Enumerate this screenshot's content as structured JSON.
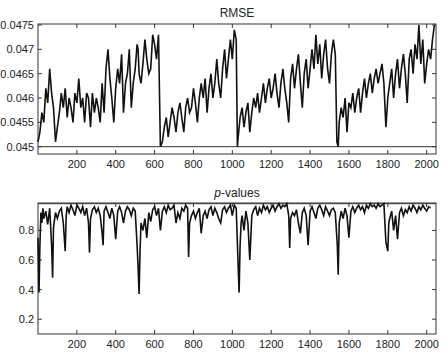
{
  "chart_data": [
    {
      "type": "line",
      "title": "RMSE",
      "xlabel": "",
      "ylabel": "",
      "xlim": [
        0,
        2048
      ],
      "ylim": [
        0.04485,
        0.04752
      ],
      "xticks": [
        200,
        400,
        600,
        800,
        1000,
        1200,
        1400,
        1600,
        1800,
        2000
      ],
      "yticks": [
        0.045,
        0.0455,
        0.046,
        0.0465,
        0.047,
        0.0475
      ],
      "ytick_labels": [
        "0.045",
        "0.0455",
        "0.046",
        "0.0465",
        "0.047",
        "0.0475"
      ],
      "grid": false,
      "reference_line": 0.045,
      "series": [
        {
          "name": "RMSE",
          "x": [
            0,
            10,
            20,
            30,
            40,
            50,
            60,
            70,
            80,
            90,
            100,
            110,
            120,
            130,
            140,
            150,
            160,
            170,
            180,
            190,
            200,
            210,
            220,
            230,
            240,
            250,
            260,
            270,
            280,
            290,
            300,
            310,
            320,
            330,
            340,
            350,
            360,
            370,
            380,
            390,
            400,
            410,
            420,
            430,
            440,
            450,
            460,
            470,
            480,
            490,
            500,
            510,
            515,
            520,
            530,
            540,
            550,
            560,
            570,
            580,
            590,
            600,
            610,
            620,
            630,
            640,
            650,
            660,
            670,
            680,
            690,
            700,
            710,
            720,
            730,
            740,
            750,
            760,
            770,
            780,
            790,
            800,
            810,
            820,
            830,
            840,
            850,
            860,
            870,
            880,
            890,
            900,
            910,
            920,
            930,
            940,
            950,
            960,
            970,
            980,
            990,
            1000,
            1010,
            1020,
            1026,
            1030,
            1040,
            1050,
            1060,
            1070,
            1080,
            1090,
            1100,
            1110,
            1120,
            1130,
            1140,
            1150,
            1160,
            1170,
            1180,
            1190,
            1200,
            1210,
            1220,
            1230,
            1240,
            1250,
            1260,
            1270,
            1280,
            1290,
            1300,
            1310,
            1320,
            1330,
            1340,
            1350,
            1360,
            1370,
            1380,
            1390,
            1400,
            1410,
            1420,
            1430,
            1440,
            1450,
            1460,
            1470,
            1480,
            1490,
            1500,
            1510,
            1520,
            1530,
            1538,
            1545,
            1550,
            1560,
            1570,
            1580,
            1590,
            1600,
            1610,
            1620,
            1630,
            1640,
            1650,
            1660,
            1670,
            1680,
            1690,
            1700,
            1710,
            1720,
            1730,
            1740,
            1750,
            1760,
            1770,
            1780,
            1790,
            1800,
            1810,
            1820,
            1830,
            1840,
            1850,
            1860,
            1870,
            1880,
            1890,
            1900,
            1910,
            1920,
            1930,
            1940,
            1950,
            1960,
            1970,
            1980,
            1990,
            2000,
            2010,
            2020,
            2030,
            2040,
            2048
          ],
          "values": [
            0.0451,
            0.0453,
            0.0457,
            0.0455,
            0.0462,
            0.0459,
            0.0466,
            0.0461,
            0.0458,
            0.0451,
            0.0454,
            0.0457,
            0.0461,
            0.0458,
            0.0462,
            0.0456,
            0.046,
            0.0458,
            0.0455,
            0.0461,
            0.0459,
            0.0464,
            0.0458,
            0.046,
            0.0455,
            0.0461,
            0.046,
            0.0454,
            0.0461,
            0.0457,
            0.046,
            0.0458,
            0.0455,
            0.0463,
            0.0457,
            0.0466,
            0.047,
            0.0464,
            0.046,
            0.0455,
            0.0462,
            0.0466,
            0.0463,
            0.0469,
            0.0457,
            0.0463,
            0.0465,
            0.047,
            0.0458,
            0.0463,
            0.0466,
            0.0471,
            0.047,
            0.0465,
            0.0463,
            0.0467,
            0.0472,
            0.0468,
            0.0465,
            0.0466,
            0.0473,
            0.0471,
            0.0468,
            0.0473,
            0.045,
            0.0451,
            0.0454,
            0.0456,
            0.0452,
            0.0455,
            0.0458,
            0.0456,
            0.0453,
            0.0457,
            0.0459,
            0.0456,
            0.0453,
            0.0458,
            0.046,
            0.0457,
            0.0458,
            0.0462,
            0.0459,
            0.0455,
            0.046,
            0.0463,
            0.046,
            0.0464,
            0.0457,
            0.0462,
            0.0465,
            0.046,
            0.0463,
            0.0468,
            0.0463,
            0.046,
            0.0466,
            0.047,
            0.0464,
            0.0468,
            0.0472,
            0.0468,
            0.0474,
            0.0472,
            0.045,
            0.0452,
            0.0456,
            0.0458,
            0.0454,
            0.0457,
            0.0459,
            0.0453,
            0.0457,
            0.046,
            0.0458,
            0.0461,
            0.0457,
            0.046,
            0.0463,
            0.0459,
            0.0462,
            0.0464,
            0.046,
            0.0462,
            0.0465,
            0.0461,
            0.0458,
            0.0463,
            0.0466,
            0.0462,
            0.0459,
            0.0455,
            0.0464,
            0.0467,
            0.0462,
            0.0466,
            0.0469,
            0.0463,
            0.0458,
            0.0465,
            0.0468,
            0.0462,
            0.0466,
            0.047,
            0.0466,
            0.0473,
            0.0467,
            0.0471,
            0.0464,
            0.0469,
            0.0472,
            0.0466,
            0.0463,
            0.0469,
            0.0472,
            0.0469,
            0.0451,
            0.045,
            0.0455,
            0.0458,
            0.0456,
            0.046,
            0.0453,
            0.0459,
            0.0458,
            0.0461,
            0.0457,
            0.046,
            0.0462,
            0.0457,
            0.0461,
            0.0464,
            0.046,
            0.0463,
            0.0465,
            0.0461,
            0.0464,
            0.0466,
            0.0463,
            0.0465,
            0.0467,
            0.0463,
            0.0454,
            0.046,
            0.0463,
            0.0466,
            0.046,
            0.0465,
            0.0468,
            0.0462,
            0.0466,
            0.0469,
            0.0465,
            0.0459,
            0.0468,
            0.047,
            0.0465,
            0.0471,
            0.0468,
            0.0475,
            0.0467,
            0.0472,
            0.0463,
            0.0467,
            0.047,
            0.0468,
            0.0472,
            0.0475
          ]
        }
      ]
    },
    {
      "type": "line",
      "title": "p-values",
      "title_italic_part": "p",
      "title_rest": "-values",
      "xlabel": "",
      "ylabel": "",
      "xlim": [
        0,
        2048
      ],
      "ylim": [
        0.1,
        0.985
      ],
      "xticks": [
        200,
        400,
        600,
        800,
        1000,
        1200,
        1400,
        1600,
        1800,
        2000
      ],
      "yticks": [
        0.2,
        0.4,
        0.6,
        0.8
      ],
      "ytick_labels": [
        "0.2",
        "0.4",
        "0.6",
        "0.8"
      ],
      "grid": false,
      "reference_line": 0.98,
      "series": [
        {
          "name": "p-values",
          "x": [
            0,
            5,
            10,
            15,
            20,
            25,
            30,
            40,
            50,
            60,
            70,
            75,
            80,
            90,
            100,
            110,
            120,
            130,
            140,
            145,
            150,
            160,
            170,
            180,
            190,
            200,
            210,
            220,
            230,
            240,
            250,
            260,
            265,
            270,
            280,
            290,
            300,
            310,
            320,
            330,
            335,
            340,
            350,
            360,
            370,
            380,
            390,
            400,
            410,
            420,
            430,
            440,
            450,
            460,
            470,
            480,
            490,
            500,
            510,
            515,
            520,
            525,
            530,
            540,
            550,
            560,
            570,
            580,
            590,
            600,
            610,
            620,
            630,
            640,
            650,
            660,
            670,
            680,
            690,
            700,
            710,
            720,
            730,
            740,
            750,
            760,
            770,
            775,
            780,
            790,
            800,
            810,
            820,
            830,
            840,
            850,
            860,
            870,
            880,
            890,
            900,
            910,
            920,
            930,
            940,
            950,
            960,
            970,
            980,
            990,
            1000,
            1010,
            1020,
            1030,
            1035,
            1040,
            1045,
            1050,
            1060,
            1070,
            1080,
            1090,
            1100,
            1110,
            1120,
            1130,
            1140,
            1150,
            1160,
            1170,
            1180,
            1190,
            1200,
            1210,
            1220,
            1230,
            1240,
            1250,
            1260,
            1270,
            1280,
            1290,
            1295,
            1300,
            1310,
            1320,
            1330,
            1340,
            1350,
            1360,
            1370,
            1380,
            1390,
            1400,
            1410,
            1420,
            1430,
            1440,
            1450,
            1460,
            1470,
            1480,
            1490,
            1500,
            1510,
            1520,
            1530,
            1540,
            1545,
            1550,
            1560,
            1570,
            1580,
            1590,
            1600,
            1610,
            1620,
            1630,
            1640,
            1650,
            1660,
            1670,
            1680,
            1690,
            1700,
            1710,
            1720,
            1730,
            1740,
            1750,
            1760,
            1770,
            1780,
            1790,
            1800,
            1805,
            1810,
            1820,
            1830,
            1840,
            1850,
            1860,
            1870,
            1880,
            1890,
            1900,
            1910,
            1920,
            1930,
            1940,
            1950,
            1960,
            1970,
            1980,
            1990,
            2000,
            2010,
            2020,
            2030,
            2040,
            2048
          ],
          "values": [
            0.75,
            0.38,
            0.7,
            0.92,
            0.85,
            0.95,
            0.88,
            0.93,
            0.84,
            0.95,
            0.7,
            0.48,
            0.82,
            0.92,
            0.88,
            0.93,
            0.95,
            0.85,
            0.66,
            0.9,
            0.96,
            0.92,
            0.97,
            0.94,
            0.9,
            0.97,
            0.95,
            0.92,
            0.96,
            0.9,
            0.95,
            0.85,
            0.65,
            0.88,
            0.94,
            0.96,
            0.92,
            0.95,
            0.9,
            0.78,
            0.7,
            0.93,
            0.96,
            0.92,
            0.88,
            0.95,
            0.9,
            0.74,
            0.93,
            0.96,
            0.92,
            0.85,
            0.93,
            0.96,
            0.94,
            0.9,
            0.95,
            0.93,
            0.7,
            0.55,
            0.37,
            0.65,
            0.85,
            0.8,
            0.88,
            0.75,
            0.92,
            0.86,
            0.94,
            0.96,
            0.9,
            0.95,
            0.8,
            0.93,
            0.96,
            0.92,
            0.97,
            0.94,
            0.95,
            0.97,
            0.85,
            0.92,
            0.88,
            0.95,
            0.93,
            0.97,
            0.95,
            0.62,
            0.85,
            0.9,
            0.93,
            0.88,
            0.92,
            0.95,
            0.78,
            0.9,
            0.93,
            0.88,
            0.94,
            0.96,
            0.9,
            0.95,
            0.92,
            0.88,
            0.85,
            0.94,
            0.96,
            0.92,
            0.95,
            0.97,
            0.9,
            0.97,
            0.95,
            0.55,
            0.38,
            0.7,
            0.85,
            0.9,
            0.8,
            0.93,
            0.85,
            0.6,
            0.9,
            0.94,
            0.96,
            0.9,
            0.95,
            0.92,
            0.97,
            0.94,
            0.96,
            0.92,
            0.95,
            0.97,
            0.93,
            0.96,
            0.98,
            0.95,
            0.97,
            0.96,
            0.98,
            0.9,
            0.68,
            0.88,
            0.92,
            0.9,
            0.94,
            0.85,
            0.78,
            0.92,
            0.95,
            0.9,
            0.7,
            0.93,
            0.96,
            0.92,
            0.88,
            0.95,
            0.97,
            0.94,
            0.9,
            0.96,
            0.93,
            0.9,
            0.94,
            0.95,
            0.92,
            0.7,
            0.5,
            0.85,
            0.93,
            0.88,
            0.95,
            0.9,
            0.75,
            0.93,
            0.96,
            0.92,
            0.95,
            0.97,
            0.94,
            0.96,
            0.92,
            0.97,
            0.95,
            0.98,
            0.96,
            0.97,
            0.95,
            0.98,
            0.96,
            0.97,
            0.98,
            0.72,
            0.66,
            0.85,
            0.88,
            0.93,
            0.8,
            0.9,
            0.74,
            0.92,
            0.95,
            0.9,
            0.94,
            0.92,
            0.96,
            0.93,
            0.97,
            0.95,
            0.92,
            0.96,
            0.94,
            0.97,
            0.95,
            0.93,
            0.96,
            0.95
          ]
        }
      ]
    }
  ]
}
